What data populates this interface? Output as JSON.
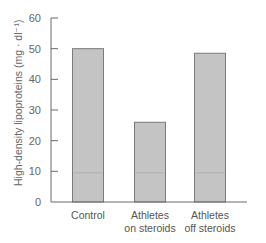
{
  "chart_data": {
    "type": "bar",
    "title": "",
    "xlabel": "",
    "ylabel": "High-density lipoproteins (mg · dl⁻¹)",
    "categories": [
      "Control",
      "Athletes on steroids",
      "Athletes off steroids"
    ],
    "category_lines": [
      [
        "Control"
      ],
      [
        "Athletes",
        "on steroids"
      ],
      [
        "Athletes",
        "off steroids"
      ]
    ],
    "values": [
      50,
      26,
      48.5
    ],
    "ylim": [
      0,
      60
    ],
    "yticks": [
      0,
      10,
      20,
      30,
      40,
      50,
      60
    ],
    "grid": false,
    "legend": null,
    "bar_color": "#c4c4c4",
    "bar_edge_color": "#7a7a7a",
    "axis_color": "#6a6a6a"
  }
}
